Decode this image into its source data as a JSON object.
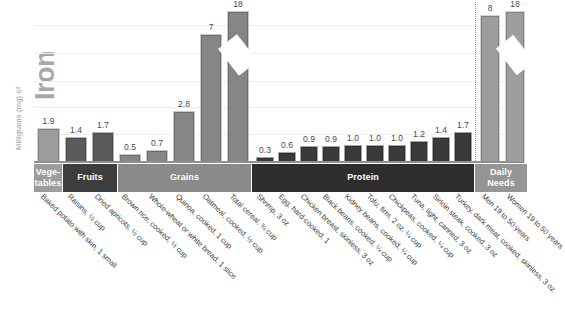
{
  "axis": {
    "ylabel_small": "Milligrams (mg) of",
    "ylabel_big": "Iron"
  },
  "bands": [
    {
      "key": "veg",
      "label": "Vege-\ntables"
    },
    {
      "key": "fruit",
      "label": "Fruits"
    },
    {
      "key": "grain",
      "label": "Grains"
    },
    {
      "key": "prot",
      "label": "Protein"
    },
    {
      "key": "daily",
      "label": "Daily\nNeeds"
    }
  ],
  "chart_data": {
    "type": "bar",
    "title": "Milligrams (mg) of Iron",
    "xlabel": "",
    "ylabel": "Milligrams (mg) of Iron",
    "ylim": [
      0,
      8.6
    ],
    "grid": true,
    "legend": "none",
    "note": "Two bars (Total cereal and Women 19 to 50 years) use a broken axis to show value 18",
    "categories": [
      "Baked potato with skin, 1 small",
      "Raisins, 1/2 cup",
      "Dried apricots, 1/2 cup",
      "Brown rice, cooked, 1/2 cup",
      "Whole-wheat or white bread, 1 slice",
      "Quinoa, cooked, 1 cup",
      "Oatmeal, cooked, 1/2 cup",
      "Total cereal, 3/4 cup",
      "Shrimp, 3 oz",
      "Egg, hard-cooked, 1",
      "Chicken breast, skinless, 3 oz",
      "Black beans, cooked, 1/4 cup",
      "Kidney beans, cooked, 1/4 cup",
      "Tofu, firm, 2 oz, 1/4 cup",
      "Chickpeas, cooked, 1/4 cup",
      "Tuna, light, canned, 3 oz",
      "Sirloin steak, cooked, 3 oz",
      "Turkey, dark meat, cooked, skinless, 3 oz",
      "Men 19 to 50 years",
      "Women 19 to 50 years"
    ],
    "values": [
      1.9,
      1.4,
      1.7,
      0.5,
      0.7,
      2.8,
      7,
      18,
      0.3,
      0.6,
      0.9,
      0.9,
      1.0,
      1.0,
      1.0,
      1.2,
      1.4,
      1.7,
      8,
      18
    ],
    "value_labels": [
      "1.9",
      "1.4",
      "1.7",
      "0.5",
      "0.7",
      "2.8",
      "7",
      "18",
      "0.3",
      "0.6",
      "0.9",
      "0.9",
      "1.0",
      "1.0",
      "1.0",
      "1.2",
      "1.4",
      "1.7",
      "8",
      "18"
    ],
    "group_of": [
      "veg",
      "fruit",
      "fruit",
      "grain",
      "grain",
      "grain",
      "grain",
      "grain",
      "prot",
      "prot",
      "prot",
      "prot",
      "prot",
      "prot",
      "prot",
      "prot",
      "prot",
      "prot",
      "daily",
      "daily"
    ],
    "broken": [
      false,
      false,
      false,
      false,
      false,
      false,
      false,
      true,
      false,
      false,
      false,
      false,
      false,
      false,
      false,
      false,
      false,
      false,
      false,
      true
    ],
    "gridlines": [
      1.5,
      3.0,
      4.4,
      5.9,
      7.4
    ]
  },
  "colors": {
    "vegetables": "#9d9d9d",
    "fruits": "#3d3d3d",
    "grains": "#8a8a8a",
    "protein": "#2d2d2d",
    "daily_needs": "#959595",
    "gridline": "#ededed",
    "baseline": "#8f8f8f",
    "value_text": "#4a4a4a",
    "axis_title": "#a8a8a8"
  }
}
